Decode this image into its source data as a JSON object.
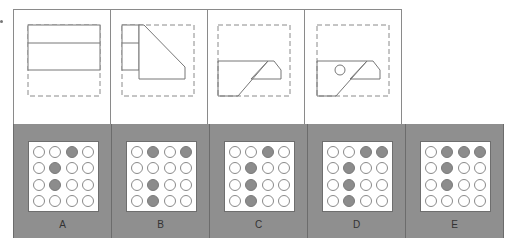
{
  "figure": {
    "question_marker": "•",
    "top_panels": [
      {
        "id": "step-1",
        "description": "Square sheet with top half folded down (two horizontal bands)"
      },
      {
        "id": "step-2",
        "description": "Folded left portion with diagonal corner fold"
      },
      {
        "id": "step-3",
        "description": "Folded strip with angled flap"
      },
      {
        "id": "step-4",
        "description": "Folded shape with punched circle hole"
      }
    ],
    "options": [
      {
        "label": "A",
        "grid": [
          [
            0,
            0,
            1,
            0
          ],
          [
            0,
            1,
            0,
            0
          ],
          [
            0,
            1,
            0,
            0
          ],
          [
            0,
            0,
            0,
            0
          ]
        ]
      },
      {
        "label": "B",
        "grid": [
          [
            0,
            1,
            0,
            1
          ],
          [
            0,
            0,
            0,
            0
          ],
          [
            0,
            1,
            0,
            0
          ],
          [
            0,
            1,
            0,
            0
          ]
        ]
      },
      {
        "label": "C",
        "grid": [
          [
            0,
            0,
            1,
            0
          ],
          [
            0,
            1,
            0,
            0
          ],
          [
            0,
            1,
            0,
            0
          ],
          [
            0,
            1,
            0,
            0
          ]
        ]
      },
      {
        "label": "D",
        "grid": [
          [
            0,
            0,
            1,
            1
          ],
          [
            0,
            1,
            0,
            0
          ],
          [
            0,
            1,
            0,
            0
          ],
          [
            0,
            1,
            0,
            0
          ]
        ]
      },
      {
        "label": "E",
        "grid": [
          [
            0,
            1,
            1,
            1
          ],
          [
            0,
            1,
            0,
            0
          ],
          [
            0,
            1,
            0,
            0
          ],
          [
            0,
            0,
            0,
            0
          ]
        ]
      }
    ]
  },
  "colors": {
    "panel_border": "#8a8a8a",
    "option_bg": "#8f8f8f",
    "dot_filled": "#8c8c8c",
    "dot_empty": "#ffffff"
  }
}
